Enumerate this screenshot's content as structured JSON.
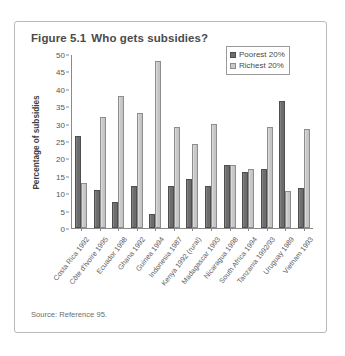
{
  "figure": {
    "title_number": "Figure 5.1",
    "title_text": "Who gets subsidies?",
    "source": "Source: Reference 95."
  },
  "legend": {
    "position": "top-right",
    "entries": [
      {
        "label": "Poorest 20%",
        "color": "#6e6e6e",
        "icon": "legend-swatch-poorest"
      },
      {
        "label": "Richest 20%",
        "color": "#c9c9c9",
        "icon": "legend-swatch-richest"
      }
    ]
  },
  "chart_data": {
    "type": "bar",
    "xlabel": "",
    "ylabel": "Percentage of subsidies",
    "ylim": [
      0,
      50
    ],
    "yticks": [
      0,
      5,
      10,
      15,
      20,
      25,
      30,
      35,
      40,
      45,
      50
    ],
    "grid": false,
    "legend_position": "top-right",
    "categories": [
      "Costa Rica 1992",
      "Côte d'Ivoire 1995",
      "Ecuador 1998",
      "Ghana 1992",
      "Guinea 1994",
      "Indonesia 1987",
      "Kenya 1992 (rural)",
      "Madagascar 1993",
      "Nicaragua 1998",
      "South Africa 1994",
      "Tanzania 1992/93",
      "Uruguay 1989",
      "Vietnam 1993"
    ],
    "series": [
      {
        "name": "Poorest 20%",
        "color": "#6e6e6e",
        "values": [
          26.5,
          11.0,
          7.5,
          12.0,
          4.0,
          12.0,
          14.0,
          12.0,
          18.0,
          16.0,
          17.0,
          36.5,
          11.5
        ]
      },
      {
        "name": "Richest 20%",
        "color": "#c9c9c9",
        "values": [
          13.0,
          32.0,
          38.0,
          33.0,
          48.0,
          29.0,
          24.0,
          30.0,
          18.0,
          17.0,
          29.0,
          10.5,
          28.5
        ]
      }
    ]
  }
}
